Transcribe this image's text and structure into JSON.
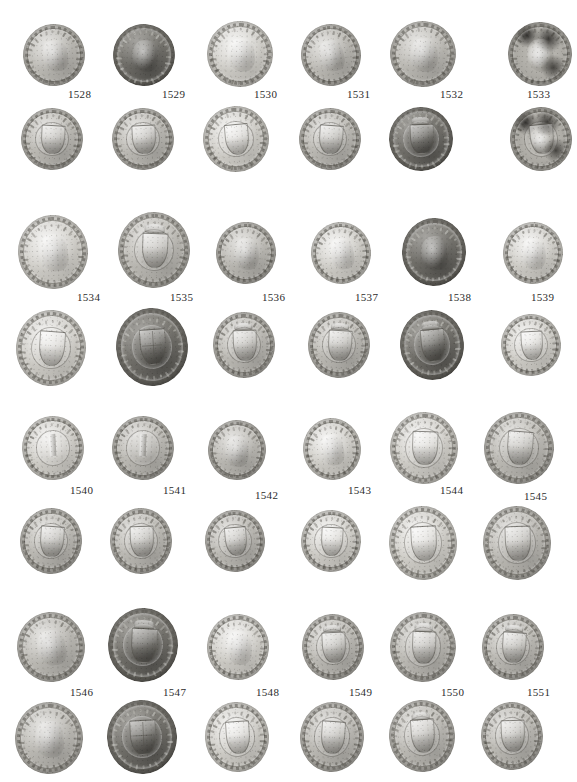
{
  "plate": {
    "type": "numismatic-photo-plate",
    "background_color": "#ffffff",
    "width": 577,
    "height": 782,
    "columns": 6,
    "blocks": 4,
    "rows_per_block": 2,
    "label_row": "between obverse row and reverse row",
    "total_specimens": 24,
    "label_color": "#2c2c2c"
  },
  "blocks": [
    {
      "id": "block-1",
      "specimens": [
        {
          "catalog_number": "1528",
          "label_x": 68,
          "label_y": 88,
          "obverse": {
            "x": 23,
            "y": 24,
            "w": 62,
            "h": 62,
            "tone": "normal",
            "device": "bust",
            "rotate": -4
          },
          "reverse": {
            "x": 21,
            "y": 108,
            "w": 62,
            "h": 62,
            "tone": "normal",
            "device": "shield",
            "rotate": 3
          }
        },
        {
          "catalog_number": "1529",
          "label_x": 162,
          "label_y": 88,
          "obverse": {
            "x": 113,
            "y": 24,
            "w": 62,
            "h": 62,
            "tone": "dark",
            "device": "bust",
            "rotate": 6
          },
          "reverse": {
            "x": 112,
            "y": 108,
            "w": 62,
            "h": 62,
            "tone": "normal",
            "device": "shield",
            "rotate": -3
          }
        },
        {
          "catalog_number": "1530",
          "label_x": 254,
          "label_y": 88,
          "obverse": {
            "x": 207,
            "y": 21,
            "w": 66,
            "h": 66,
            "tone": "light",
            "device": "bust",
            "rotate": 2
          },
          "reverse": {
            "x": 203,
            "y": 106,
            "w": 66,
            "h": 66,
            "tone": "light",
            "device": "shield",
            "rotate": -5
          }
        },
        {
          "catalog_number": "1531",
          "label_x": 347,
          "label_y": 88,
          "obverse": {
            "x": 301,
            "y": 24,
            "w": 60,
            "h": 62,
            "tone": "normal",
            "device": "bust",
            "rotate": -8
          },
          "reverse": {
            "x": 299,
            "y": 108,
            "w": 62,
            "h": 62,
            "tone": "normal",
            "device": "shield",
            "rotate": 4
          }
        },
        {
          "catalog_number": "1532",
          "label_x": 440,
          "label_y": 88,
          "obverse": {
            "x": 390,
            "y": 21,
            "w": 66,
            "h": 66,
            "tone": "normal",
            "device": "bust",
            "rotate": 5
          },
          "reverse": {
            "x": 389,
            "y": 107,
            "w": 64,
            "h": 64,
            "tone": "dark",
            "device": "crowned-shield",
            "rotate": -2
          }
        },
        {
          "catalog_number": "1533",
          "label_x": 527,
          "label_y": 88,
          "obverse": {
            "x": 508,
            "y": 22,
            "w": 64,
            "h": 64,
            "tone": "mottled",
            "device": "bust",
            "rotate": 3
          },
          "reverse": {
            "x": 510,
            "y": 107,
            "w": 62,
            "h": 64,
            "tone": "mottled",
            "device": "shield",
            "rotate": -6
          }
        }
      ]
    },
    {
      "id": "block-2",
      "specimens": [
        {
          "catalog_number": "1534",
          "label_x": 77,
          "label_y": 291,
          "obverse": {
            "x": 18,
            "y": 215,
            "w": 70,
            "h": 74,
            "tone": "light",
            "device": "bust",
            "rotate": -3
          },
          "reverse": {
            "x": 16,
            "y": 310,
            "w": 70,
            "h": 76,
            "tone": "light",
            "device": "shield",
            "rotate": 4
          }
        },
        {
          "catalog_number": "1535",
          "label_x": 170,
          "label_y": 291,
          "obverse": {
            "x": 118,
            "y": 212,
            "w": 72,
            "h": 76,
            "tone": "normal",
            "device": "crowned-shield",
            "rotate": 2
          },
          "reverse": {
            "x": 116,
            "y": 308,
            "w": 72,
            "h": 78,
            "tone": "dark",
            "device": "quartered-shield",
            "rotate": -4
          }
        },
        {
          "catalog_number": "1536",
          "label_x": 262,
          "label_y": 291,
          "obverse": {
            "x": 216,
            "y": 222,
            "w": 60,
            "h": 62,
            "tone": "normal",
            "device": "bust",
            "rotate": 5
          },
          "reverse": {
            "x": 213,
            "y": 312,
            "w": 62,
            "h": 66,
            "tone": "normal",
            "device": "crowned-shield",
            "rotate": -2
          }
        },
        {
          "catalog_number": "1537",
          "label_x": 355,
          "label_y": 291,
          "obverse": {
            "x": 311,
            "y": 222,
            "w": 60,
            "h": 62,
            "tone": "light",
            "device": "bust",
            "rotate": -4
          },
          "reverse": {
            "x": 308,
            "y": 312,
            "w": 62,
            "h": 66,
            "tone": "normal",
            "device": "crowned-shield",
            "rotate": 3
          }
        },
        {
          "catalog_number": "1538",
          "label_x": 448,
          "label_y": 291,
          "obverse": {
            "x": 402,
            "y": 218,
            "w": 64,
            "h": 68,
            "tone": "dark",
            "device": "bust",
            "rotate": 2
          },
          "reverse": {
            "x": 400,
            "y": 310,
            "w": 64,
            "h": 70,
            "tone": "dark",
            "device": "crowned-shield",
            "rotate": -5
          }
        },
        {
          "catalog_number": "1539",
          "label_x": 531,
          "label_y": 291,
          "obverse": {
            "x": 503,
            "y": 222,
            "w": 60,
            "h": 62,
            "tone": "light",
            "device": "bust",
            "rotate": 4
          },
          "reverse": {
            "x": 501,
            "y": 314,
            "w": 60,
            "h": 62,
            "tone": "light",
            "device": "shield",
            "rotate": -3
          }
        }
      ]
    },
    {
      "id": "block-3",
      "specimens": [
        {
          "catalog_number": "1540",
          "label_x": 70,
          "label_y": 484,
          "obverse": {
            "x": 22,
            "y": 416,
            "w": 62,
            "h": 64,
            "tone": "light",
            "device": "pillar",
            "rotate": -3
          },
          "reverse": {
            "x": 20,
            "y": 508,
            "w": 62,
            "h": 66,
            "tone": "normal",
            "device": "shield",
            "rotate": 4
          }
        },
        {
          "catalog_number": "1541",
          "label_x": 163,
          "label_y": 484,
          "obverse": {
            "x": 112,
            "y": 416,
            "w": 62,
            "h": 64,
            "tone": "normal",
            "device": "pillar",
            "rotate": 3
          },
          "reverse": {
            "x": 110,
            "y": 508,
            "w": 62,
            "h": 66,
            "tone": "normal",
            "device": "shield",
            "rotate": -2
          }
        },
        {
          "catalog_number": "1542",
          "label_x": 255,
          "label_y": 489,
          "obverse": {
            "x": 208,
            "y": 420,
            "w": 58,
            "h": 60,
            "tone": "normal",
            "device": "bust",
            "rotate": 6
          },
          "reverse": {
            "x": 205,
            "y": 510,
            "w": 60,
            "h": 62,
            "tone": "normal",
            "device": "shield",
            "rotate": -5
          }
        },
        {
          "catalog_number": "1543",
          "label_x": 348,
          "label_y": 484,
          "obverse": {
            "x": 303,
            "y": 418,
            "w": 58,
            "h": 62,
            "tone": "light",
            "device": "bust",
            "rotate": -4
          },
          "reverse": {
            "x": 301,
            "y": 510,
            "w": 60,
            "h": 62,
            "tone": "light",
            "device": "shield",
            "rotate": 3
          }
        },
        {
          "catalog_number": "1544",
          "label_x": 440,
          "label_y": 484,
          "obverse": {
            "x": 390,
            "y": 412,
            "w": 68,
            "h": 72,
            "tone": "light",
            "device": "shield",
            "rotate": 2
          },
          "reverse": {
            "x": 389,
            "y": 506,
            "w": 68,
            "h": 74,
            "tone": "light",
            "device": "shield",
            "rotate": -3
          }
        },
        {
          "catalog_number": "1545",
          "label_x": 524,
          "label_y": 490,
          "obverse": {
            "x": 484,
            "y": 412,
            "w": 70,
            "h": 72,
            "tone": "normal",
            "device": "shield",
            "rotate": 4
          },
          "reverse": {
            "x": 483,
            "y": 506,
            "w": 68,
            "h": 74,
            "tone": "normal",
            "device": "shield",
            "rotate": -2
          }
        }
      ]
    },
    {
      "id": "block-4",
      "specimens": [
        {
          "catalog_number": "1546",
          "label_x": 70,
          "label_y": 686,
          "obverse": {
            "x": 17,
            "y": 612,
            "w": 68,
            "h": 70,
            "tone": "normal",
            "device": "bust",
            "rotate": -4
          },
          "reverse": {
            "x": 15,
            "y": 702,
            "w": 68,
            "h": 72,
            "tone": "normal",
            "device": "bust",
            "rotate": 3
          }
        },
        {
          "catalog_number": "1547",
          "label_x": 163,
          "label_y": 686,
          "obverse": {
            "x": 108,
            "y": 608,
            "w": 70,
            "h": 74,
            "tone": "dark",
            "device": "crowned-shield",
            "rotate": 3
          },
          "reverse": {
            "x": 107,
            "y": 700,
            "w": 70,
            "h": 74,
            "tone": "dark",
            "device": "quartered-shield",
            "rotate": -3
          }
        },
        {
          "catalog_number": "1548",
          "label_x": 256,
          "label_y": 686,
          "obverse": {
            "x": 207,
            "y": 614,
            "w": 62,
            "h": 66,
            "tone": "light",
            "device": "bust",
            "rotate": 5
          },
          "reverse": {
            "x": 205,
            "y": 702,
            "w": 64,
            "h": 70,
            "tone": "light",
            "device": "shield",
            "rotate": -4
          }
        },
        {
          "catalog_number": "1549",
          "label_x": 349,
          "label_y": 686,
          "obverse": {
            "x": 302,
            "y": 614,
            "w": 62,
            "h": 66,
            "tone": "normal",
            "device": "crowned-shield",
            "rotate": -3
          },
          "reverse": {
            "x": 300,
            "y": 702,
            "w": 64,
            "h": 70,
            "tone": "normal",
            "device": "shield",
            "rotate": 4
          }
        },
        {
          "catalog_number": "1550",
          "label_x": 441,
          "label_y": 686,
          "obverse": {
            "x": 390,
            "y": 612,
            "w": 66,
            "h": 70,
            "tone": "normal",
            "device": "crowned-shield",
            "rotate": 2
          },
          "reverse": {
            "x": 389,
            "y": 700,
            "w": 66,
            "h": 72,
            "tone": "normal",
            "device": "crowned-shield",
            "rotate": -4
          }
        },
        {
          "catalog_number": "1551",
          "label_x": 527,
          "label_y": 686,
          "obverse": {
            "x": 482,
            "y": 614,
            "w": 62,
            "h": 66,
            "tone": "normal",
            "device": "crowned-shield",
            "rotate": 4
          },
          "reverse": {
            "x": 481,
            "y": 702,
            "w": 62,
            "h": 68,
            "tone": "normal",
            "device": "shield",
            "rotate": -2
          }
        }
      ]
    }
  ]
}
